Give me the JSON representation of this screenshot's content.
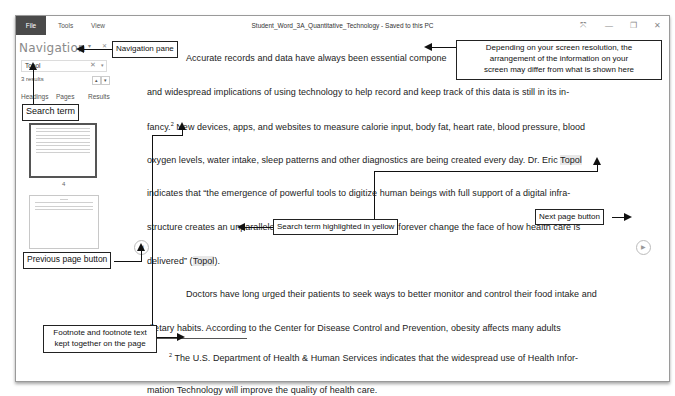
{
  "titlebar": {
    "menu": [
      "File",
      "Tools",
      "View"
    ],
    "doc_title": "Student_Word_3A_Quantitative_Technology  -  Saved to this PC",
    "controls": {
      "expand": "⤧",
      "minimize": "—",
      "restore": "❐",
      "close": "✕"
    }
  },
  "navigation": {
    "title": "Navigation",
    "dropdown_icon": "▾",
    "close_icon": "✕",
    "search": {
      "value": "Topol",
      "clear": "✕",
      "dropdown": "▾"
    },
    "results_count": "3 results",
    "prev_result": "▴",
    "next_result": "▾",
    "tabs": [
      "Headings",
      "Pages",
      "Results"
    ],
    "thumbnails": [
      {
        "page": "4"
      },
      {
        "page": "7"
      }
    ]
  },
  "document": {
    "lines": [
      "Accurate records and data have always been essential compone",
      "and widespread implications of using technology to help record and keep track of this data is still in its in-",
      "fancy.",
      " New devices, apps, and websites to measure calorie input, body fat, heart rate, blood pressure, blood",
      "oxygen levels, water intake, sleep patterns and other diagnostics are being created every day. Dr. Eric ",
      "Topol",
      "indicates that “the emergence of powerful tools to digitize human beings with full support of a digital infra-",
      "structure creates an unparalleled opportunity to inevitably and forever change the face of how health care is",
      "delivered” (",
      "Topol",
      ").",
      "Doctors have long urged their patients to seek ways to better monitor and control their food intake and",
      "dietary habits. According to the Center for Disease Control and Prevention, obesity affects many adults"
    ],
    "footnote_ref": "2",
    "footnote_lines": [
      " The U.S. Department of Health & Human Services indicates that the widespread use of Health Infor-",
      "mation Technology will improve the quality of health care."
    ],
    "prev_page_icon": "◀",
    "next_page_icon": "▶"
  },
  "callouts": {
    "navigation_pane": "Navigation pane",
    "search_term": "Search term",
    "resolution_note": [
      "Depending on your screen resolution, the",
      "arrangement of the information on your",
      "screen may differ from what is shown here"
    ],
    "search_highlight": "Search term highlighted in yellow",
    "next_page": "Next page button",
    "previous_page": "Previous page button",
    "footnote": [
      "Footnote and footnote text",
      "kept together on the page"
    ]
  }
}
